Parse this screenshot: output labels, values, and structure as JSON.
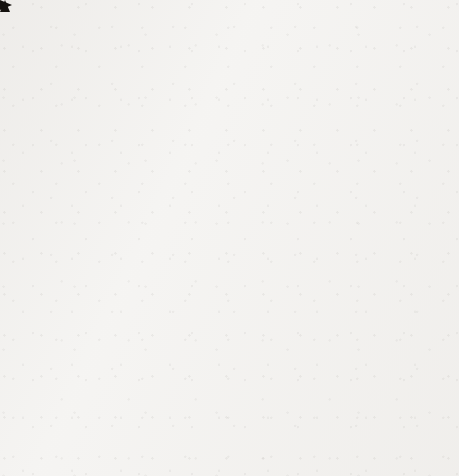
{
  "figure": {
    "kind": "cartesian-coordinate-grid",
    "background_color": "#f4f3f1",
    "ink_color": "#15120f",
    "grid_color": "#5d5a57"
  },
  "axes": {
    "x_axis_label": "x",
    "y_axis_label": "y",
    "origin_label": "0",
    "x_arrow": "arrow-right",
    "y_arrow": "arrow-up"
  },
  "chart_data": {
    "type": "scatter",
    "title": "",
    "subtitle": "",
    "xlabel": "x",
    "ylabel": "y",
    "xlim": [
      -8,
      8
    ],
    "ylim": [
      -8,
      8
    ],
    "xticks": [
      -8,
      -7,
      -6,
      -5,
      -4,
      -3,
      -2,
      -1,
      1,
      2,
      3,
      4,
      5,
      6,
      7,
      8
    ],
    "yticks": [
      -8,
      -7,
      -6,
      -5,
      -4,
      -3,
      -2,
      -1,
      1,
      2,
      3,
      4,
      5,
      6,
      7,
      8
    ],
    "xtick_labels": [
      "–8",
      "–7",
      "–6",
      "–5",
      "–4",
      "–3",
      "–2",
      "–1",
      "1",
      "2",
      "3",
      "4",
      "5",
      "6",
      "7",
      "8"
    ],
    "ytick_labels": [
      "–8",
      "–7",
      "–6",
      "–5",
      "–4",
      "–3",
      "–2",
      "–1",
      "1",
      "2",
      "3",
      "4",
      "5",
      "6",
      "7",
      "8"
    ],
    "origin_tick_label": "0",
    "grid": true,
    "grid_style": "dotted",
    "grid_step": 1,
    "legend": null,
    "legend_position": "none",
    "series": [],
    "annotations": [],
    "x": [],
    "y": [],
    "values": [],
    "categories": []
  }
}
